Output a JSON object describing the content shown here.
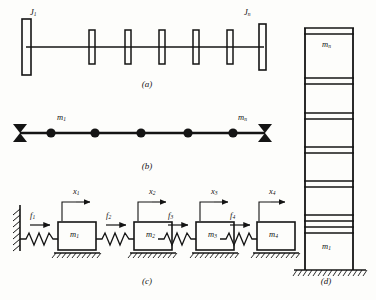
{
  "figure": {
    "background_color": "#fdfdfb",
    "ink_color": "#141414"
  },
  "panels": [
    {
      "id": "a",
      "caption": "(a)",
      "name": "torsional-shaft-with-disks",
      "labels": [
        {
          "base": "J",
          "sub": "1",
          "x": 30,
          "y": 11
        },
        {
          "base": "J",
          "sub": "n",
          "x": 246,
          "y": 11
        }
      ],
      "shaft": {
        "y": 47,
        "x_start": 26,
        "x_end": 264
      },
      "disks": [
        {
          "cx": 26,
          "w": 9,
          "h": 55,
          "type": "large"
        },
        {
          "cx": 92,
          "w": 6,
          "h": 33,
          "type": "small"
        },
        {
          "cx": 128,
          "w": 6,
          "h": 33,
          "type": "small"
        },
        {
          "cx": 162,
          "w": 6,
          "h": 33,
          "type": "small"
        },
        {
          "cx": 196,
          "w": 6,
          "h": 33,
          "type": "small"
        },
        {
          "cx": 230,
          "w": 6,
          "h": 33,
          "type": "small"
        },
        {
          "cx": 262,
          "w": 7,
          "h": 45,
          "type": "large"
        }
      ]
    },
    {
      "id": "b",
      "caption": "(b)",
      "name": "simply-supported-beam-with-masses",
      "labels": [
        {
          "base": "m",
          "sub": "1",
          "x": 58,
          "y": 117
        },
        {
          "base": "m",
          "sub": "n",
          "x": 240,
          "y": 117
        }
      ],
      "beam": {
        "y": 133,
        "x_start": 22,
        "x_end": 262
      },
      "supports": [
        {
          "cx": 20
        },
        {
          "cx": 264
        }
      ],
      "masses": [
        {
          "cx": 51
        },
        {
          "cx": 93
        },
        {
          "cx": 140
        },
        {
          "cx": 188
        },
        {
          "cx": 232
        }
      ]
    },
    {
      "id": "c",
      "caption": "(c)",
      "name": "spring-mass-chain",
      "wall": {
        "x": 19,
        "y_top": 208,
        "y_bottom": 252
      },
      "ground_y": 253,
      "masses": [
        {
          "label_base": "m",
          "label_sub": "1",
          "x": 57,
          "y": 222,
          "w": 38,
          "h": 27
        },
        {
          "label_base": "m",
          "label_sub": "2",
          "x": 120,
          "y": 222,
          "w": 38,
          "h": 27
        },
        {
          "label_base": "m",
          "label_sub": "3",
          "x": 183,
          "y": 222,
          "w": 38,
          "h": 27
        },
        {
          "label_base": "m",
          "label_sub": "4",
          "x": 243,
          "y": 222,
          "w": 38,
          "h": 27
        }
      ],
      "forces": [
        {
          "base": "f",
          "sub": "1",
          "x": 32,
          "y": 212
        },
        {
          "base": "f",
          "sub": "2",
          "x": 101,
          "y": 212
        },
        {
          "base": "f",
          "sub": "3",
          "x": 163,
          "y": 212
        },
        {
          "base": "f",
          "sub": "4",
          "x": 225,
          "y": 212
        }
      ],
      "displacements": [
        {
          "base": "x",
          "sub": "1",
          "x": 74,
          "y": 188
        },
        {
          "base": "x",
          "sub": "2",
          "x": 136,
          "y": 188
        },
        {
          "base": "x",
          "sub": "3",
          "x": 198,
          "y": 188
        },
        {
          "base": "x",
          "sub": "4",
          "x": 256,
          "y": 188
        }
      ]
    },
    {
      "id": "d",
      "caption": "(d)",
      "name": "multistory-shear-building",
      "labels": [
        {
          "base": "m",
          "sub": "n",
          "x": 328,
          "y": 40
        },
        {
          "base": "m",
          "sub": "1",
          "x": 328,
          "y": 238
        }
      ],
      "frame": {
        "x_left": 304,
        "x_right": 352,
        "y_top": 28,
        "y_base": 270
      },
      "floor_levels": [
        28,
        60,
        95,
        128,
        160,
        192,
        224
      ],
      "ground_y": 272,
      "story_count": 7
    }
  ],
  "captions": [
    {
      "text": "(a)",
      "x": 130,
      "y": 80
    },
    {
      "text": "(b)",
      "x": 130,
      "y": 162
    },
    {
      "text": "(c)",
      "x": 130,
      "y": 277
    },
    {
      "text": "(d)",
      "x": 308,
      "y": 277
    }
  ]
}
